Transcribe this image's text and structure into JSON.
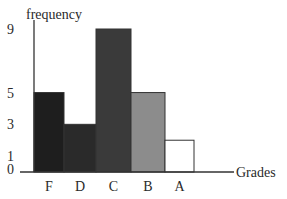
{
  "chart_data": {
    "type": "bar",
    "title": "",
    "xlabel": "Grades",
    "ylabel": "frequency",
    "categories": [
      "F",
      "D",
      "C",
      "B",
      "A"
    ],
    "values": [
      5,
      3,
      9,
      5,
      2
    ],
    "bar_colors": [
      "#1e1e1e",
      "#2a2a2a",
      "#3a3a3a",
      "#8c8c8c",
      "#ffffff"
    ],
    "yticks": [
      0,
      1,
      3,
      5,
      9
    ],
    "ylim": [
      0,
      9
    ],
    "grid": false,
    "legend": null
  }
}
